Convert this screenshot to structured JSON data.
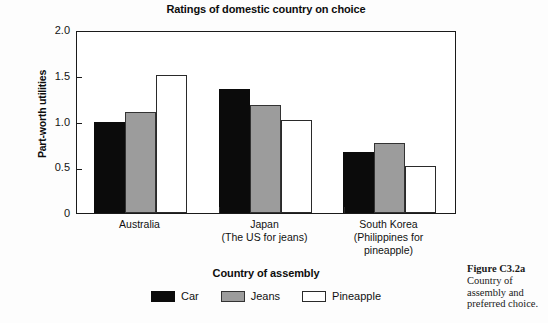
{
  "chart_data": {
    "type": "bar",
    "title": "Ratings of domestic country on choice",
    "xlabel": "Country of assembly",
    "ylabel": "Part-worth utilities",
    "ylim": [
      0,
      2.0
    ],
    "yticks": [
      "0",
      "0.5",
      "1.0",
      "1.5",
      "2.0"
    ],
    "ytick_values": [
      0,
      0.5,
      1.0,
      1.5,
      2.0
    ],
    "grid": false,
    "legend_position": "bottom-center",
    "categories": [
      "Australia",
      "Japan\n(The US for jeans)",
      "South Korea\n(Philippines for\npineapple)"
    ],
    "category_lines": [
      [
        "Australia"
      ],
      [
        "Japan",
        "(The US for jeans)"
      ],
      [
        "South Korea",
        "(Philippines for",
        "pineapple)"
      ]
    ],
    "series": [
      {
        "name": "Car",
        "color": "#0b0b0b",
        "values": [
          1.0,
          1.35,
          0.67
        ]
      },
      {
        "name": "Jeans",
        "color": "#9c9c9c",
        "values": [
          1.1,
          1.18,
          0.76
        ]
      },
      {
        "name": "Pineapple",
        "color": "#ffffff",
        "values": [
          1.51,
          1.02,
          0.51
        ]
      }
    ]
  },
  "caption": {
    "figure_number": "Figure C3.2a",
    "text": "Country of assembly and preferred choice."
  },
  "colors": {
    "car": "#0b0b0b",
    "jeans": "#9c9c9c",
    "pineapple": "#ffffff",
    "axis": "#1a1a1a",
    "background": "#fdfdfd"
  }
}
